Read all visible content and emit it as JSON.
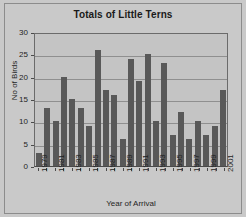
{
  "chart_data": {
    "type": "bar",
    "title": "Totals of Little Terns",
    "xlabel": "Year of Arrival",
    "ylabel": "No of Birds",
    "categories": [
      "1979",
      "1980",
      "1981",
      "1982",
      "1983",
      "1984",
      "1985",
      "1986",
      "1987",
      "1988",
      "1989",
      "1990",
      "1991",
      "1992",
      "1993",
      "1994",
      "1995",
      "1996",
      "1997",
      "1998",
      "1999",
      "2000",
      "2001"
    ],
    "values": [
      3,
      13,
      10,
      20,
      15,
      13,
      9,
      26,
      17,
      16,
      6,
      24,
      19,
      25,
      10,
      23,
      7,
      12,
      6,
      10,
      7,
      9,
      17
    ],
    "tick_labels": [
      "1979",
      "1981",
      "1983",
      "1985",
      "1987",
      "1989",
      "1991",
      "1993",
      "1995",
      "1997",
      "1999",
      "2001"
    ],
    "ylim": [
      0,
      30
    ],
    "yticks": [
      0,
      5,
      10,
      15,
      20,
      25,
      30
    ],
    "ytick_labels": [
      "0",
      "5",
      "10",
      "15",
      "20",
      "25",
      "30"
    ],
    "grid": true,
    "legend": null,
    "bar_color": "#595959",
    "plot_background": "#c4c4c4",
    "figure_background": "#c9c9c9",
    "gridline_color": "#8f8f8f",
    "axis_color": "#4a4a4a",
    "text_color": "#1f1f1f"
  }
}
